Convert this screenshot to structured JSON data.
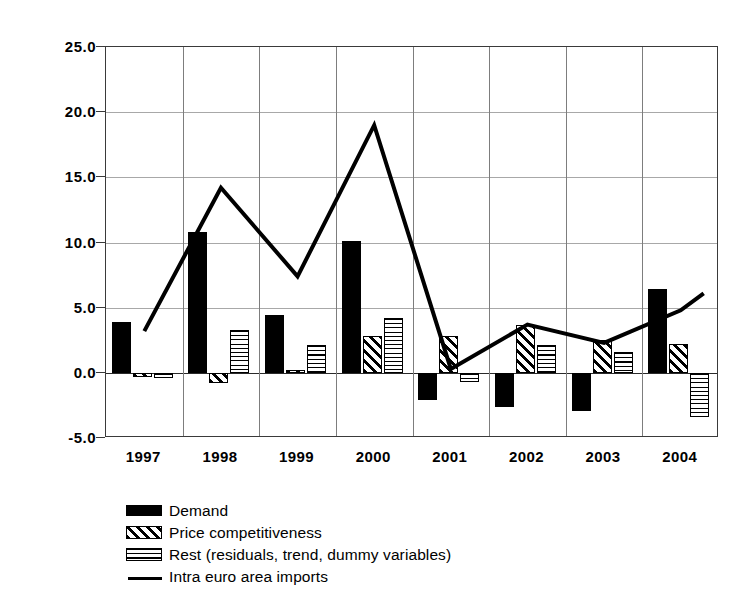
{
  "chart_data": {
    "type": "bar",
    "title": "",
    "subtitle": "",
    "xlabel": "",
    "ylabel": "",
    "categories": [
      "1997",
      "1998",
      "1999",
      "2000",
      "2001",
      "2002",
      "2003",
      "2004"
    ],
    "ylim": [
      -5.0,
      25.0
    ],
    "yticks": [
      "-5.0",
      "0.0",
      "5.0",
      "10.0",
      "15.0",
      "20.0",
      "25.0"
    ],
    "ytick_values": [
      -5.0,
      0.0,
      5.0,
      10.0,
      15.0,
      20.0,
      25.0
    ],
    "grid": true,
    "legend_position": "below-left",
    "series": [
      {
        "name": "Demand",
        "type": "bar",
        "pattern": "solid-black",
        "values": [
          3.9,
          10.8,
          4.4,
          10.1,
          -2.1,
          -2.6,
          -2.9,
          6.4
        ]
      },
      {
        "name": "Price competitiveness",
        "type": "bar",
        "pattern": "diagonal-hatch",
        "values": [
          -0.3,
          -0.8,
          0.25,
          2.8,
          2.8,
          3.7,
          2.5,
          2.2
        ]
      },
      {
        "name": "Rest (residuals, trend, dummy variables)",
        "type": "bar",
        "pattern": "horizontal-lines",
        "values": [
          -0.4,
          3.3,
          2.1,
          4.2,
          -0.7,
          2.1,
          1.6,
          -3.4
        ]
      },
      {
        "name": "Intra euro area imports",
        "type": "line",
        "pattern": "solid-line",
        "values": [
          3.2,
          14.2,
          7.4,
          19.0,
          0.3,
          3.7,
          2.3,
          4.8
        ],
        "extension_value": 6.1
      }
    ],
    "colors": {
      "demand": "#000000",
      "price_competitiveness": "#000000",
      "rest": "#000000",
      "line": "#000000",
      "gridline": "#a8a8a8",
      "axis": "#3a3a3a",
      "background": "#ffffff"
    }
  },
  "legend": {
    "items": [
      {
        "label": "Demand",
        "key": "swatch-solid-black"
      },
      {
        "label": "Price competitiveness",
        "key": "swatch-diagonal-hatch"
      },
      {
        "label": "Rest (residuals, trend, dummy variables)",
        "key": "swatch-horizontal-lines"
      },
      {
        "label": "Intra euro area imports",
        "key": "swatch-line"
      }
    ]
  }
}
